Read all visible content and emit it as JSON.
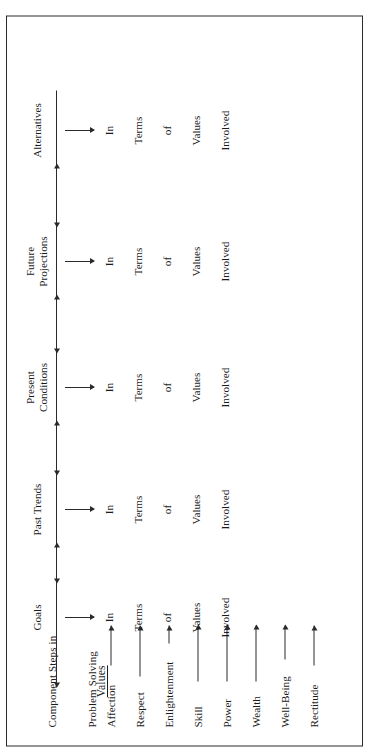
{
  "figure": {
    "stub_head_line1": "Component Steps in",
    "stub_head_line2": "Problem Solving",
    "values_stub": "Values",
    "border_color": "#2a2a2a",
    "text_color": "#1c1c1c",
    "background": "#ffffff"
  },
  "columns": [
    {
      "id": "goals",
      "line1": "Goals",
      "line2": ""
    },
    {
      "id": "past-trends",
      "line1": "Past Trends",
      "line2": ""
    },
    {
      "id": "present-conditions",
      "line1": "Present",
      "line2": "Conditions"
    },
    {
      "id": "future-projections",
      "line1": "Future",
      "line2": "Projections"
    },
    {
      "id": "alternatives",
      "line1": "Alternatives",
      "line2": ""
    }
  ],
  "rows": [
    {
      "id": "affection",
      "label": "Affection"
    },
    {
      "id": "respect",
      "label": "Respect"
    },
    {
      "id": "enlightenment",
      "label": "Enlightenment"
    },
    {
      "id": "skill",
      "label": "Skill"
    },
    {
      "id": "power",
      "label": "Power"
    },
    {
      "id": "wealth",
      "label": "Wealth"
    },
    {
      "id": "well-being",
      "label": "Well-Being"
    },
    {
      "id": "rectitude",
      "label": "Rectitude"
    }
  ],
  "cell_phrase": {
    "words": [
      "In",
      "Terms",
      "of",
      "Values",
      "Involved"
    ],
    "full_text": "In Terms of Values Involved"
  },
  "chart_data": {
    "type": "table",
    "title": "Component Steps in Problem Solving",
    "row_group_label": "Values",
    "columns": [
      "Goals",
      "Past Trends",
      "Present Conditions",
      "Future Projections",
      "Alternatives"
    ],
    "rows": [
      "Affection",
      "Respect",
      "Enlightenment",
      "Skill",
      "Power",
      "Wealth",
      "Well-Being",
      "Rectitude"
    ],
    "cell_content": "In Terms of Values Involved"
  }
}
